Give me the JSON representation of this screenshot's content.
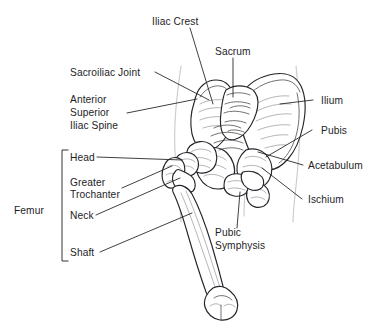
{
  "figure": {
    "background_color": "#ffffff",
    "text_color": "#1d1d1f",
    "leader_color": "#1d1d1f",
    "bone_outline_color": "#24242a",
    "body_outline_color": "#c9c9cf"
  },
  "labels": {
    "iliac_crest": "Iliac Crest",
    "sacrum": "Sacrum",
    "sacroiliac_joint": "Sacroiliac Joint",
    "anterior_line1": "Anterior",
    "anterior_line2": "Superior",
    "anterior_line3": "Iliac Spine",
    "ilium": "Ilium",
    "pubis": "Pubis",
    "acetabulum": "Acetabulum",
    "ischium": "Ischium",
    "femur": "Femur",
    "head": "Head",
    "greater_line1": "Greater",
    "greater_line2": "Trochanter",
    "neck": "Neck",
    "shaft": "Shaft",
    "pubic_line1": "Pubic",
    "pubic_line2": "Symphysis"
  }
}
